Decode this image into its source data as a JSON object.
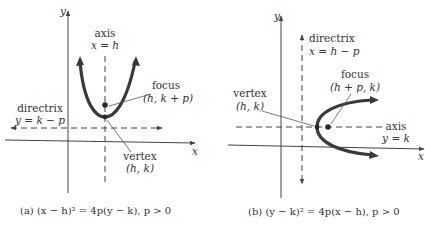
{
  "figures": [
    {
      "id": "a",
      "axis_labels": {
        "x": "x",
        "y": "y"
      },
      "axis_of_symmetry": {
        "label": "axis",
        "equation": "x = h"
      },
      "directrix": {
        "label": "directrix",
        "equation": "y = k − p"
      },
      "focus": {
        "label": "focus",
        "coords": "(h, k + p)"
      },
      "vertex": {
        "label": "vertex",
        "coords": "(h, k)"
      },
      "orientation": "opens upward",
      "caption": "(a) (x − h)² = 4p(y − k),   p > 0"
    },
    {
      "id": "b",
      "axis_labels": {
        "x": "x",
        "y": "y"
      },
      "axis_of_symmetry": {
        "label": "axis",
        "equation": "y = k"
      },
      "directrix": {
        "label": "directrix",
        "equation": "x = h − p"
      },
      "focus": {
        "label": "focus",
        "coords": "(h + p, k)"
      },
      "vertex": {
        "label": "vertex",
        "coords": "(h, k)"
      },
      "orientation": "opens rightward",
      "caption": "(b) (y − k)² = 4p(x − h),   p > 0"
    }
  ],
  "colors": {
    "ink": "#333333",
    "curve": "#3a3a3a",
    "background": "#ffffff"
  }
}
